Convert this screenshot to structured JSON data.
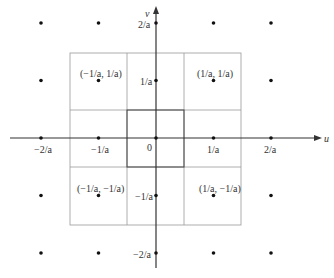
{
  "diagram": {
    "title": "",
    "axes": {
      "x_label": "u",
      "y_label": "v",
      "origin_label": "0",
      "x_ticks": [
        {
          "value": -2,
          "label": "−2/a"
        },
        {
          "value": -1,
          "label": "−1/a"
        },
        {
          "value": 1,
          "label": "1/a"
        },
        {
          "value": 2,
          "label": "2/a"
        }
      ],
      "y_ticks": [
        {
          "value": 2,
          "label": "2/a"
        },
        {
          "value": 1,
          "label": "1/a"
        },
        {
          "value": -1,
          "label": "−1/a"
        },
        {
          "value": -2,
          "label": "−2/a"
        }
      ]
    },
    "point_labels": [
      {
        "x": -1,
        "y": 1,
        "label": "(−1/a, 1/a)"
      },
      {
        "x": 1,
        "y": 1,
        "label": "(1/a, 1/a)"
      },
      {
        "x": -1,
        "y": -1,
        "label": "(−1/a, −1/a)"
      },
      {
        "x": 1,
        "y": -1,
        "label": "(1/a, −1/a)"
      }
    ],
    "lattice_points": [
      [
        -2,
        2
      ],
      [
        -1,
        2
      ],
      [
        0,
        2
      ],
      [
        1,
        2
      ],
      [
        2,
        2
      ],
      [
        -2,
        1
      ],
      [
        -1,
        1
      ],
      [
        0,
        1
      ],
      [
        1,
        1
      ],
      [
        2,
        1
      ],
      [
        -2,
        0
      ],
      [
        -1,
        0
      ],
      [
        0,
        0
      ],
      [
        1,
        0
      ],
      [
        2,
        0
      ],
      [
        -2,
        -1
      ],
      [
        -1,
        -1
      ],
      [
        0,
        -1
      ],
      [
        1,
        -1
      ],
      [
        2,
        -1
      ],
      [
        -2,
        -2
      ],
      [
        -1,
        -2
      ],
      [
        0,
        -2
      ],
      [
        1,
        -2
      ],
      [
        2,
        -2
      ]
    ],
    "regions": {
      "inner_square": "[-1/(2a), 1/(2a)] x [-1/(2a), 1/(2a)]",
      "outer_square": "[-3/(2a), 3/(2a)] x [-3/(2a), 3/(2a)]"
    },
    "colors": {
      "axis": "#333333",
      "grid_outer": "#999999",
      "grid_inner": "#444444",
      "point": "#111111"
    }
  }
}
